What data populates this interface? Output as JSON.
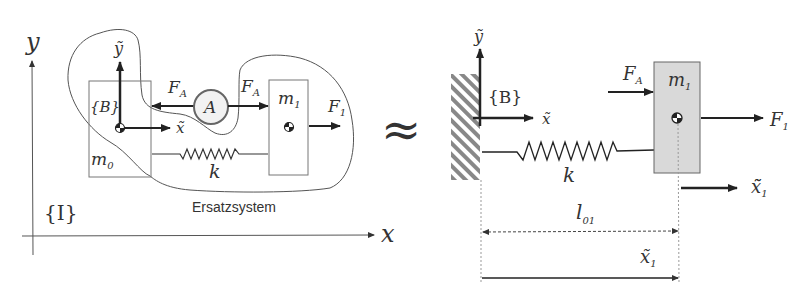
{
  "left_diagram": {
    "axis_x_label": "x",
    "axis_y_label": "y",
    "inertial_frame_label": "{I}",
    "body_frame_label": "{B}",
    "body_x_axis_label": "x̃",
    "body_y_axis_label": "ỹ",
    "mass0_label": "m",
    "mass0_sub": "0",
    "mass1_label": "m",
    "mass1_sub": "1",
    "actuator_label": "A",
    "force_A_left_label": "F",
    "force_A_left_sub": "A",
    "force_A_right_label": "F",
    "force_A_right_sub": "A",
    "force_1_label": "F",
    "force_1_sub": "1",
    "spring_label": "k",
    "substitute_system_label": "Ersatzsystem"
  },
  "approx_symbol": "≈",
  "right_diagram": {
    "body_frame_label": "{B}",
    "body_x_axis_label": "x̃",
    "body_y_axis_label": "ỹ",
    "mass1_label": "m",
    "mass1_sub": "1",
    "force_A_label": "F",
    "force_A_sub": "A",
    "force_1_label": "F",
    "force_1_sub": "1",
    "spring_label": "k",
    "displacement_label": "x̃̃",
    "displacement_sub": "1",
    "rest_length_label": "l",
    "rest_length_sub": "01",
    "position_label": "x̃",
    "position_sub": "1"
  },
  "colors": {
    "line": "#222222",
    "thin_line": "#555555",
    "mass_fill": "#d9d9d9",
    "hatch": "#888888"
  }
}
